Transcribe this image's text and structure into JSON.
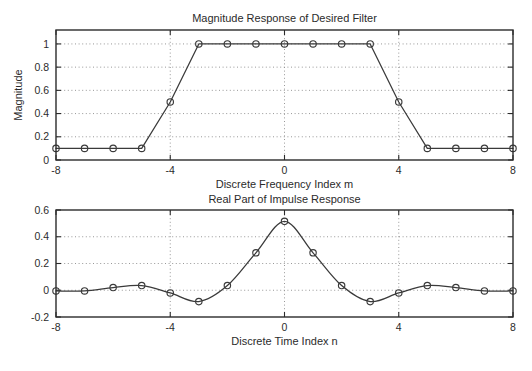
{
  "figure": {
    "background_color": "#ffffff",
    "axis_color": "#2b2b2b",
    "grid_color": "#8c8c8c",
    "line_color": "#3a3a3a",
    "width": 532,
    "height": 371
  },
  "chart_data": [
    {
      "type": "line",
      "id": "magnitude-response",
      "title": "Magnitude Response of Desired Filter",
      "xlabel": "Discrete Frequency Index m",
      "ylabel": "Magnitude",
      "xlim": [
        -8,
        8
      ],
      "ylim": [
        0,
        1.12
      ],
      "xticks": [
        -8,
        -4,
        0,
        4,
        8
      ],
      "xticklabels": [
        "-8",
        "-4",
        "0",
        "4",
        "8"
      ],
      "yticks": [
        0,
        0.2,
        0.4,
        0.6,
        0.8,
        1
      ],
      "yticklabels": [
        "0",
        "0.2",
        "0.4",
        "0.6",
        "0.8",
        "1"
      ],
      "grid": true,
      "markers": "circle",
      "x": [
        -8,
        -7,
        -6,
        -5,
        -4,
        -3,
        -2,
        -1,
        0,
        1,
        2,
        3,
        4,
        5,
        6,
        7,
        8
      ],
      "values": [
        0.1,
        0.1,
        0.1,
        0.1,
        0.5,
        1.0,
        1.0,
        1.0,
        1.0,
        1.0,
        1.0,
        1.0,
        0.5,
        0.1,
        0.1,
        0.1,
        0.1
      ]
    },
    {
      "type": "line",
      "id": "impulse-response",
      "title": "Real Part of Impulse Response",
      "xlabel": "Discrete Time Index n",
      "ylabel": "",
      "xlim": [
        -8,
        8
      ],
      "ylim": [
        -0.2,
        0.6
      ],
      "xticks": [
        -8,
        -4,
        0,
        4,
        8
      ],
      "xticklabels": [
        "-8",
        "-4",
        "0",
        "4",
        "8"
      ],
      "yticks": [
        -0.2,
        0,
        0.2,
        0.4,
        0.6
      ],
      "yticklabels": [
        "-0.2",
        "0",
        "0.2",
        "0.4",
        "0.6"
      ],
      "grid": true,
      "markers": "circle",
      "smooth": true,
      "x": [
        -8,
        -7,
        -6,
        -5,
        -4,
        -3,
        -2,
        -1,
        0,
        1,
        2,
        3,
        4,
        5,
        6,
        7,
        8
      ],
      "values": [
        -0.005,
        -0.005,
        0.02,
        0.035,
        -0.02,
        -0.085,
        0.035,
        0.28,
        0.515,
        0.28,
        0.035,
        -0.085,
        -0.02,
        0.035,
        0.02,
        -0.005,
        -0.005
      ]
    }
  ]
}
